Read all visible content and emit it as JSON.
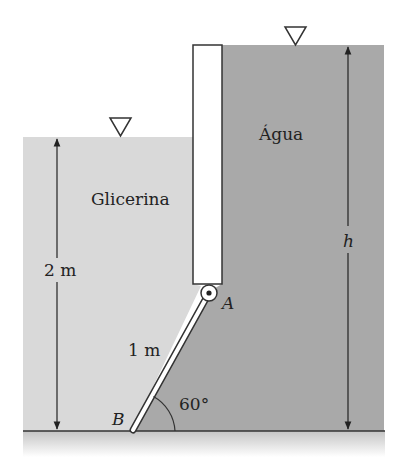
{
  "figure": {
    "fluids": {
      "left": {
        "label": "Glicerina",
        "color": "#d9d9d9"
      },
      "right": {
        "label": "Água",
        "color": "#a9a9a9"
      }
    },
    "dimensions": {
      "left_depth": "2 m",
      "right_depth": "h",
      "gate_length": "1 m",
      "gate_angle": "60°"
    },
    "points": {
      "hinge": "A",
      "bottom": "B"
    },
    "colors": {
      "line": "#333333",
      "wall_fill": "#ffffff",
      "ground_top": "#c4c4c4"
    }
  }
}
